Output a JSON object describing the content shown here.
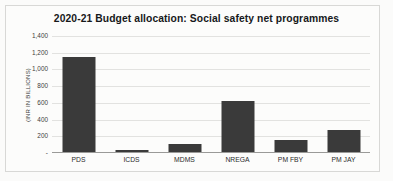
{
  "chart_data": {
    "type": "bar",
    "title": "2020-21 Budget allocation:  Social safety net programmes",
    "xlabel": "",
    "ylabel": "(INR IN BILLIONS)",
    "categories": [
      "PDS",
      "ICDS",
      "MDMS",
      "NREGA",
      "PM FBY",
      "PM JAY"
    ],
    "values": [
      1150,
      35,
      110,
      620,
      160,
      280
    ],
    "ylim": [
      0,
      1400
    ],
    "ytick_values": [
      0,
      200,
      400,
      600,
      800,
      1000,
      1200,
      1400
    ],
    "ytick_labels": [
      "-",
      "200",
      "400",
      "600",
      "800",
      "1,000",
      "1,200",
      "1,400"
    ],
    "grid": true,
    "legend": false,
    "series_color": "#3a3a3a"
  },
  "colors": {
    "background": "#fbfbfa",
    "border": "#d8d8d6",
    "bar": "#3a3a3a",
    "gridline": "#e2e2e0",
    "axis": "#9a9a98",
    "text": "#16181a"
  }
}
